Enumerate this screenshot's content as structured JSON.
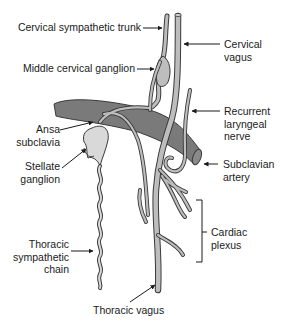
{
  "diagram": {
    "type": "anatomical",
    "colors": {
      "nerve_fill": "#bdbdbd",
      "nerve_stroke": "#3a3a3a",
      "artery_fill": "#7a7a7a",
      "ganglion_fill": "#d9d9d9",
      "label_text": "#1a1a1a"
    },
    "labels": {
      "cervical_sympathetic_trunk": "Cervical sympathetic trunk",
      "cervical_vagus": "Cervical\nvagus",
      "middle_cervical_ganglion": "Middle cervical ganglion",
      "recurrent_laryngeal_nerve": "Recurrent\nlaryngeal\nnerve",
      "ansa_subclavia": "Ansa\nsubclavia",
      "stellate_ganglion": "Stellate\nganglion",
      "subclavian_artery": "Subclavian\nartery",
      "cardiac_plexus": "Cardiac\nplexus",
      "thoracic_sympathetic_chain": "Thoracic\nsympathetic\nchain",
      "thoracic_vagus": "Thoracic vagus"
    }
  }
}
